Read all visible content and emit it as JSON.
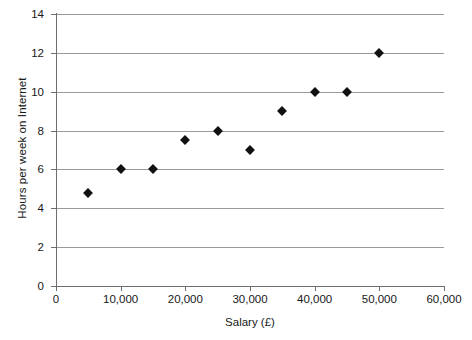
{
  "chart_data": {
    "type": "scatter",
    "title": "",
    "xlabel": "Salary (£)",
    "ylabel": "Hours per week on Internet",
    "xlim": [
      0,
      60000
    ],
    "ylim": [
      0,
      14
    ],
    "xticks": [
      0,
      10000,
      20000,
      30000,
      40000,
      50000,
      60000
    ],
    "xtick_labels": [
      "0",
      "10,000",
      "20,000",
      "30,000",
      "40,000",
      "50,000",
      "60,000"
    ],
    "yticks": [
      0,
      2,
      4,
      6,
      8,
      10,
      12,
      14
    ],
    "ytick_labels": [
      "0",
      "2",
      "4",
      "6",
      "8",
      "10",
      "12",
      "14"
    ],
    "grid": "horizontal",
    "legend": "none",
    "marker": "diamond",
    "marker_color": "#111111",
    "gridline_color": "#9a9a9a",
    "axis_color": "#6e6e6e",
    "background": "#ffffff",
    "x": [
      5000,
      10000,
      15000,
      20000,
      25000,
      30000,
      35000,
      40000,
      45000,
      50000
    ],
    "y": [
      4.8,
      6,
      6,
      7.5,
      8,
      7,
      9,
      10,
      10,
      12
    ],
    "points": [
      {
        "x": 5000,
        "y": 4.8
      },
      {
        "x": 10000,
        "y": 6
      },
      {
        "x": 15000,
        "y": 6
      },
      {
        "x": 20000,
        "y": 7.5
      },
      {
        "x": 25000,
        "y": 8
      },
      {
        "x": 30000,
        "y": 7
      },
      {
        "x": 35000,
        "y": 9
      },
      {
        "x": 40000,
        "y": 10
      },
      {
        "x": 45000,
        "y": 10
      },
      {
        "x": 50000,
        "y": 12
      }
    ]
  }
}
